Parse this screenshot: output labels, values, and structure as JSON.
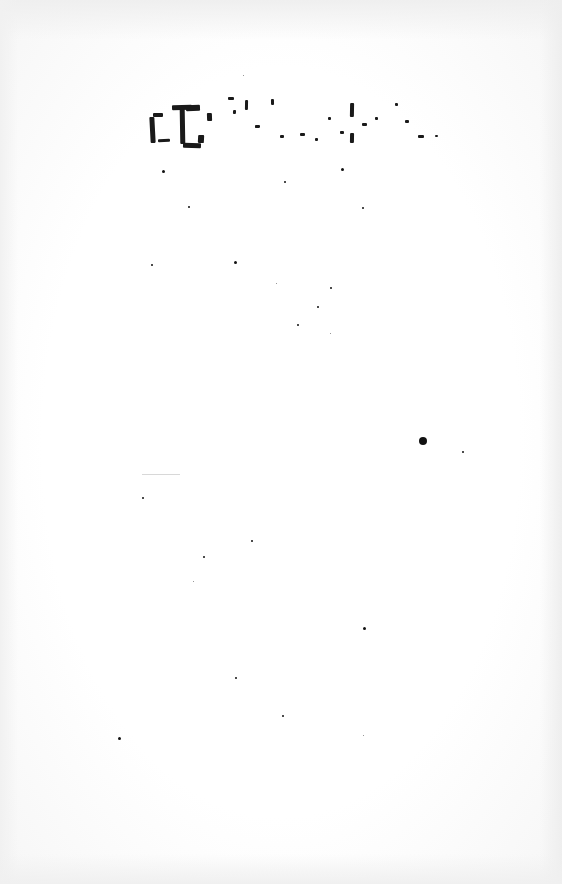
{
  "document": {
    "type": "scanned page",
    "title_fragment": "[illegible degraded text]",
    "body_text": ""
  },
  "specks": [
    {
      "x": 162,
      "y": 170,
      "s": 3
    },
    {
      "x": 284,
      "y": 181,
      "s": 2
    },
    {
      "x": 341,
      "y": 168,
      "s": 3
    },
    {
      "x": 188,
      "y": 206,
      "s": 2
    },
    {
      "x": 362,
      "y": 207,
      "s": 2
    },
    {
      "x": 151,
      "y": 264,
      "s": 2
    },
    {
      "x": 234,
      "y": 261,
      "s": 3
    },
    {
      "x": 276,
      "y": 283,
      "s": 1
    },
    {
      "x": 330,
      "y": 287,
      "s": 2
    },
    {
      "x": 317,
      "y": 306,
      "s": 2
    },
    {
      "x": 297,
      "y": 324,
      "s": 2
    },
    {
      "x": 330,
      "y": 333,
      "s": 1
    },
    {
      "x": 419,
      "y": 437,
      "s": 8
    },
    {
      "x": 462,
      "y": 451,
      "s": 2
    },
    {
      "x": 142,
      "y": 497,
      "s": 2
    },
    {
      "x": 251,
      "y": 540,
      "s": 2
    },
    {
      "x": 203,
      "y": 556,
      "s": 2
    },
    {
      "x": 193,
      "y": 581,
      "s": 1
    },
    {
      "x": 363,
      "y": 627,
      "s": 3
    },
    {
      "x": 235,
      "y": 677,
      "s": 2
    },
    {
      "x": 282,
      "y": 715,
      "s": 2
    },
    {
      "x": 118,
      "y": 737,
      "s": 3
    },
    {
      "x": 363,
      "y": 735,
      "s": 1
    },
    {
      "x": 243,
      "y": 75,
      "s": 1
    }
  ],
  "title_marks": [
    {
      "x": 0,
      "y": 22,
      "w": 5,
      "h": 26
    },
    {
      "x": 3,
      "y": 18,
      "w": 10,
      "h": 4
    },
    {
      "x": 8,
      "y": 44,
      "w": 12,
      "h": 3
    },
    {
      "x": 22,
      "y": 10,
      "w": 20,
      "h": 5
    },
    {
      "x": 30,
      "y": 14,
      "w": 5,
      "h": 35
    },
    {
      "x": 36,
      "y": 10,
      "w": 14,
      "h": 6
    },
    {
      "x": 33,
      "y": 48,
      "w": 18,
      "h": 5
    },
    {
      "x": 48,
      "y": 40,
      "w": 6,
      "h": 8
    },
    {
      "x": 57,
      "y": 18,
      "w": 5,
      "h": 8
    },
    {
      "x": 78,
      "y": 2,
      "w": 6,
      "h": 3
    },
    {
      "x": 83,
      "y": 15,
      "w": 3,
      "h": 4
    },
    {
      "x": 95,
      "y": 5,
      "w": 3,
      "h": 10
    },
    {
      "x": 105,
      "y": 30,
      "w": 5,
      "h": 3
    },
    {
      "x": 121,
      "y": 4,
      "w": 3,
      "h": 6
    },
    {
      "x": 130,
      "y": 40,
      "w": 4,
      "h": 3
    },
    {
      "x": 150,
      "y": 38,
      "w": 5,
      "h": 3
    },
    {
      "x": 165,
      "y": 43,
      "w": 3,
      "h": 3
    },
    {
      "x": 178,
      "y": 22,
      "w": 3,
      "h": 3
    },
    {
      "x": 190,
      "y": 36,
      "w": 4,
      "h": 3
    },
    {
      "x": 200,
      "y": 8,
      "w": 4,
      "h": 14
    },
    {
      "x": 200,
      "y": 38,
      "w": 4,
      "h": 10
    },
    {
      "x": 212,
      "y": 28,
      "w": 5,
      "h": 3
    },
    {
      "x": 225,
      "y": 22,
      "w": 3,
      "h": 3
    },
    {
      "x": 245,
      "y": 8,
      "w": 3,
      "h": 3
    },
    {
      "x": 255,
      "y": 25,
      "w": 4,
      "h": 3
    },
    {
      "x": 268,
      "y": 40,
      "w": 6,
      "h": 3
    },
    {
      "x": 285,
      "y": 40,
      "w": 3,
      "h": 2
    }
  ]
}
